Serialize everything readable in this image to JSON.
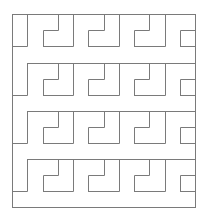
{
  "figure": {
    "width": 209,
    "height": 215,
    "background": "#ffffff",
    "stroke_color": "#7a7a7a",
    "stroke_width": 1
  },
  "border": {
    "x0": 12,
    "y0": 14,
    "x1": 195,
    "y1": 207
  },
  "grid": {
    "x_start": 12,
    "x_step": 15.25,
    "columns": 13,
    "modules_per_row": 4,
    "row_tops": [
      14,
      62.5,
      111,
      159
    ],
    "step_offset": 16,
    "bottom_offset": 32
  }
}
